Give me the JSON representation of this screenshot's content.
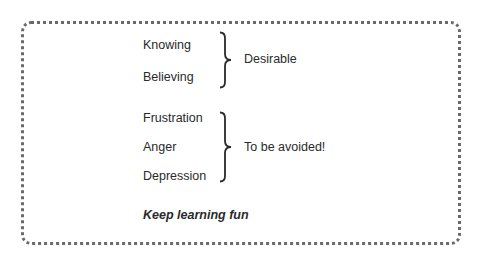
{
  "groups": [
    {
      "items": [
        "Knowing",
        "Believing"
      ],
      "label": "Desirable"
    },
    {
      "items": [
        "Frustration",
        "Anger",
        "Depression"
      ],
      "label": "To be avoided!"
    }
  ],
  "footer_note": "Keep learning fun"
}
